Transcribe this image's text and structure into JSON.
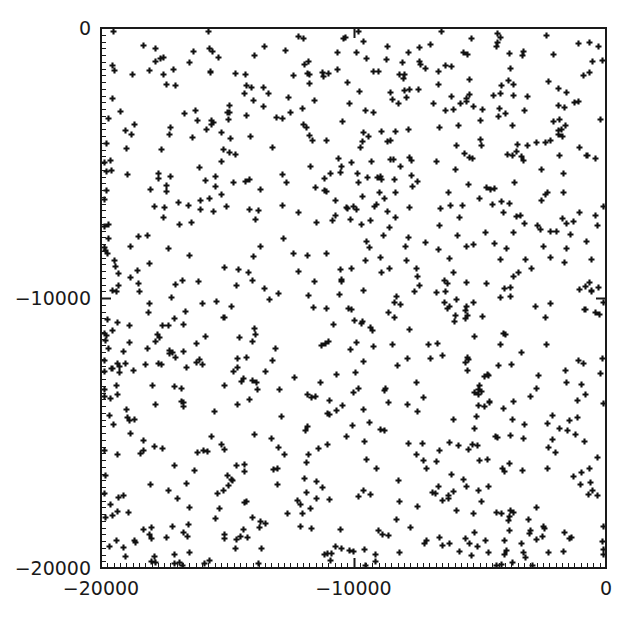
{
  "figure": {
    "width": 628,
    "height": 625,
    "background": "#ffffff",
    "foreground": "#1a1a1a"
  },
  "plot_area": {
    "left": 101,
    "top": 28,
    "right": 606,
    "bottom": 568,
    "frame_color": "#1a1a1a",
    "frame_width": 2
  },
  "axes": {
    "x_ticks_px": [
      101,
      353.5,
      606
    ],
    "y_ticks_px": [
      28,
      298,
      568
    ],
    "x_tick_labels": [
      "-20000",
      "-10000",
      "0"
    ],
    "y_tick_labels": [
      "0",
      "-10000",
      "-20000"
    ],
    "minor_tick_count": 80,
    "major_tick_len": 9,
    "minor_tick_len": 4
  },
  "marker": {
    "shape": "plus",
    "color": "#111111",
    "size_px": 6,
    "stroke_px": 2.1
  },
  "chart_data": {
    "type": "scatter",
    "title": "",
    "xlabel": "",
    "ylabel": "",
    "xlim": [
      -20000,
      0
    ],
    "ylim": [
      -20000,
      0
    ],
    "xticks": [
      -20000,
      -10000,
      0
    ],
    "yticks": [
      -20000,
      -10000,
      0
    ],
    "xticklabels": [
      "-20000",
      "-10000",
      "0"
    ],
    "yticklabels": [
      "-20000",
      "-10000",
      "0"
    ],
    "grid": false,
    "legend": null,
    "annotations": [],
    "marker_symbol": "plus",
    "marker_color": "#111111",
    "n_points": 900,
    "distribution": "uniform-random",
    "series": [
      {
        "name": "points",
        "x": [
          -19834,
          -19210,
          -18992,
          -18540,
          -18011,
          -17655,
          -17240,
          -16880,
          -16455,
          -16030,
          -15712,
          -15340,
          -14988,
          -14520,
          -14180,
          -13855,
          -13402,
          -13050,
          -12688,
          -12330,
          -11980,
          -11540,
          -11205,
          -10860,
          -10420,
          -10090,
          -9755,
          -9330,
          -8980,
          -8640,
          -8210,
          -7870,
          -7520,
          -7180,
          -6740,
          -6390,
          -6050,
          -5610,
          -5280,
          -4930,
          -4580,
          -4140,
          -3800,
          -3450,
          -3010,
          -2670,
          -2330,
          -1890,
          -1540,
          -1200,
          -760,
          -420,
          -19500,
          -19050,
          -18700,
          -18250,
          -17900,
          -17450,
          -17100,
          -16650,
          -16300,
          -15850,
          -15500,
          -15050,
          -14700,
          -14250,
          -13900,
          -13450,
          -13100,
          -12650,
          -12300,
          -11850,
          -11500,
          -11050,
          -10700,
          -10250,
          -9900,
          -9450,
          -9100,
          -8650,
          -8300,
          -7850,
          -7500,
          -7050,
          -6700,
          -6250,
          -5900,
          -5450,
          -5100,
          -4650,
          -4300,
          -3850,
          -3500,
          -3050,
          -2700,
          -2250,
          -1900,
          -1450,
          -1100,
          -650
        ],
        "y": [
          -310,
          -640,
          -980,
          -1320,
          -1660,
          -2000,
          -2340,
          -2680,
          -3020,
          -3360,
          -3700,
          -4040,
          -4380,
          -4720,
          -5060,
          -5400,
          -5740,
          -6080,
          -6420,
          -6760,
          -7100,
          -7440,
          -7780,
          -8120,
          -8460,
          -8800,
          -9140,
          -9480,
          -9820,
          -10160,
          -10500,
          -10840,
          -11180,
          -11520,
          -11860,
          -12200,
          -12540,
          -12880,
          -13220,
          -13560,
          -13900,
          -14240,
          -14580,
          -14920,
          -15260,
          -15600,
          -15940,
          -16280,
          -16620,
          -16960,
          -17300,
          -17640,
          -17980,
          -18320,
          -18660,
          -19000,
          -19340,
          -19680,
          -250,
          -590,
          -930,
          -1270,
          -1610,
          -1950,
          -2290,
          -2630,
          -2970,
          -3310,
          -3650,
          -3990,
          -4330,
          -4670,
          -5010,
          -5350,
          -5690,
          -6030,
          -6370,
          -6710,
          -7050,
          -7390,
          -7730,
          -8070,
          -8410,
          -8750,
          -9090,
          -9430,
          -9770,
          -10110,
          -10450,
          -10790,
          -11130,
          -11470,
          -11810,
          -12150,
          -12490,
          -12830,
          -13170,
          -13510,
          -13850,
          -14190
        ]
      }
    ],
    "note": "Points are uniformly randomly scattered across the full -20000..0 square in both axes; rendered positions are generated deterministically to match the observed uniform density of roughly 900 markers."
  }
}
